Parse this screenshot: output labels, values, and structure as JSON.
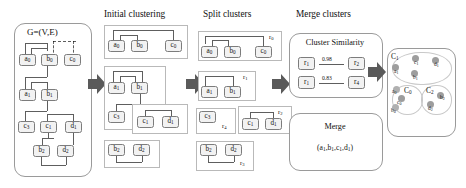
{
  "figure": {
    "type": "pipeline-diagram",
    "stage_headers": [
      {
        "id": "initial",
        "label": "Initial clustering"
      },
      {
        "id": "split",
        "label": "Split clusters"
      },
      {
        "id": "merge",
        "label": "Merge clusters"
      }
    ]
  },
  "graph_panel": {
    "title": "G=(V,E)",
    "nodes": [
      "a0",
      "b0",
      "c0",
      "a1",
      "b1",
      "c3",
      "c1",
      "d1",
      "b2",
      "d2"
    ],
    "node_labels": {
      "a0": {
        "base": "a",
        "sub": "0"
      },
      "b0": {
        "base": "b",
        "sub": "0"
      },
      "c0": {
        "base": "c",
        "sub": "0"
      },
      "a1": {
        "base": "a",
        "sub": "1"
      },
      "b1": {
        "base": "b",
        "sub": "1"
      },
      "c3": {
        "base": "c",
        "sub": "3"
      },
      "c1": {
        "base": "c",
        "sub": "1"
      },
      "d1": {
        "base": "d",
        "sub": "1"
      },
      "b2": {
        "base": "b",
        "sub": "2"
      },
      "d2": {
        "base": "d",
        "sub": "2"
      }
    }
  },
  "initial_clustering": {
    "clusters": [
      {
        "members": [
          "a0",
          "b0",
          "c0"
        ]
      },
      {
        "members": [
          "a1",
          "b1",
          "c3"
        ]
      },
      {
        "members": [
          "c1",
          "d1"
        ]
      },
      {
        "members": [
          "b2",
          "d2"
        ]
      }
    ]
  },
  "split_clusters": {
    "regions": [
      {
        "id": "r0",
        "label": {
          "base": "r",
          "sub": "0"
        },
        "members": [
          "a0",
          "b0",
          "c0"
        ]
      },
      {
        "id": "r1",
        "label": {
          "base": "r",
          "sub": "1"
        },
        "members": [
          "a1",
          "b1"
        ]
      },
      {
        "id": "r4",
        "label": {
          "base": "r",
          "sub": "4"
        },
        "members": [
          "c3"
        ]
      },
      {
        "id": "r2",
        "label": {
          "base": "r",
          "sub": "2"
        },
        "members": [
          "c1",
          "d1"
        ]
      },
      {
        "id": "r3",
        "label": {
          "base": "r",
          "sub": "3"
        },
        "members": [
          "b2",
          "d2"
        ]
      }
    ]
  },
  "merge_clusters": {
    "similarity_panel": {
      "title": "Cluster Similarity",
      "rows": [
        {
          "left": {
            "base": "r",
            "sub": "1"
          },
          "score": "0.98",
          "right": {
            "base": "r",
            "sub": "2"
          }
        },
        {
          "left": {
            "base": "r",
            "sub": "1"
          },
          "score": "0.83",
          "right": {
            "base": "r",
            "sub": "4"
          }
        }
      ]
    },
    "merge_panel": {
      "title": "Merge",
      "result_prefix": "(",
      "result_items": [
        {
          "base": "a",
          "sub": "1"
        },
        {
          "base": "b",
          "sub": "1"
        },
        {
          "base": "c",
          "sub": "1"
        },
        {
          "base": "d",
          "sub": "1"
        }
      ],
      "result_suffix": ")",
      "result_text": "(a1,b1,c1,d1)"
    }
  },
  "result_panel": {
    "clusters": [
      {
        "id": "C1",
        "label": {
          "base": "C",
          "sub": "1"
        },
        "members": [
          "a1",
          "b1",
          "c1",
          "d1"
        ]
      },
      {
        "id": "C0",
        "label": {
          "base": "C",
          "sub": "0"
        },
        "members": [
          "a0",
          "c0",
          "b0"
        ]
      },
      {
        "id": "C2",
        "label": {
          "base": "C",
          "sub": "2"
        },
        "members": [
          "b2",
          "d2"
        ]
      }
    ],
    "points": [
      {
        "id": "a1",
        "label": {
          "base": "a",
          "sub": "1"
        }
      },
      {
        "id": "b1",
        "label": {
          "base": "b",
          "sub": "1"
        }
      },
      {
        "id": "c1",
        "label": {
          "base": "c",
          "sub": "1"
        }
      },
      {
        "id": "d1",
        "label": {
          "base": "d",
          "sub": "1"
        }
      },
      {
        "id": "a0",
        "label": {
          "base": "a",
          "sub": "0"
        }
      },
      {
        "id": "c0",
        "label": {
          "base": "c",
          "sub": "0"
        }
      },
      {
        "id": "b0",
        "label": {
          "base": "b",
          "sub": "0"
        }
      },
      {
        "id": "b2",
        "label": {
          "base": "b",
          "sub": "2"
        }
      },
      {
        "id": "d2",
        "label": {
          "base": "d",
          "sub": "2"
        }
      }
    ]
  },
  "colors": {
    "node_fill": "#f2f2f2",
    "node_stroke": "#7c7c7c",
    "edge": "#5e5e5e",
    "panel_stroke": "#9a9a9a",
    "arrow": "#5a5a5a",
    "blob": "#9d9d9d"
  }
}
